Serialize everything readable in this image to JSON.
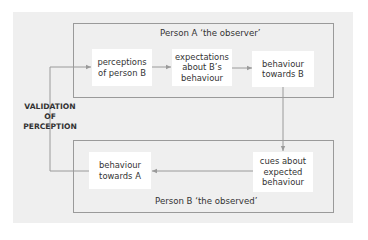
{
  "diagram": {
    "person_a": {
      "title": "Person A ‘the observer’"
    },
    "person_b": {
      "title": "Person B ‘the observed’"
    },
    "nodes": {
      "perceptions": "perceptions\nof person B",
      "expectations": "expectations\nabout B’s\nbehaviour",
      "behaviour_b": "behaviour\ntowards B",
      "cues": "cues about\nexpected\nbehaviour",
      "behaviour_a": "behaviour\ntowards A"
    },
    "validation_label": "VALIDATION\nOF\nPERCEPTION",
    "edges": [
      {
        "from": "perceptions",
        "to": "expectations"
      },
      {
        "from": "expectations",
        "to": "behaviour_b"
      },
      {
        "from": "behaviour_b",
        "to": "cues"
      },
      {
        "from": "cues",
        "to": "behaviour_a"
      },
      {
        "from": "behaviour_a",
        "to": "perceptions",
        "label": "VALIDATION OF PERCEPTION"
      }
    ],
    "colors": {
      "background": "#efefef",
      "box": "#ffffff",
      "line": "#9a9a9a",
      "text": "#333333"
    }
  }
}
